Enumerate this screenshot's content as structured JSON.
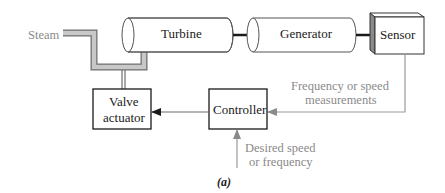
{
  "figure": {
    "caption": "(a)",
    "colors": {
      "pipe_fill": "#c8c8c8",
      "pipe_stroke": "#6e6e6e",
      "signal_line": "#9a9a9a",
      "control_line": "#6a6a6a",
      "shaft": "#1a1a1a",
      "sensor_side": "#8a8a8a",
      "text_dark": "#1a1a1a",
      "text_gray": "#8a8a8a"
    }
  },
  "components": {
    "steam": {
      "label": "Steam"
    },
    "turbine": {
      "label": "Turbine"
    },
    "generator": {
      "label": "Generator"
    },
    "sensor": {
      "label": "Sensor"
    },
    "valve_actuator": {
      "line1": "Valve",
      "line2": "actuator"
    },
    "controller": {
      "label": "Controller"
    }
  },
  "signals": {
    "measurement": {
      "line1": "Frequency or speed",
      "line2": "measurements"
    },
    "setpoint": {
      "line1": "Desired speed",
      "line2": "or frequency"
    }
  },
  "connections": [
    {
      "from": "steam",
      "to": "turbine",
      "type": "pipe"
    },
    {
      "from": "turbine",
      "to": "generator",
      "type": "shaft"
    },
    {
      "from": "generator",
      "to": "sensor",
      "type": "shaft"
    },
    {
      "from": "sensor",
      "to": "controller",
      "type": "signal"
    },
    {
      "from": "setpoint",
      "to": "controller",
      "type": "signal"
    },
    {
      "from": "controller",
      "to": "valve_actuator",
      "type": "control"
    },
    {
      "from": "valve_actuator",
      "to": "steam_pipe",
      "type": "mechanical"
    }
  ]
}
